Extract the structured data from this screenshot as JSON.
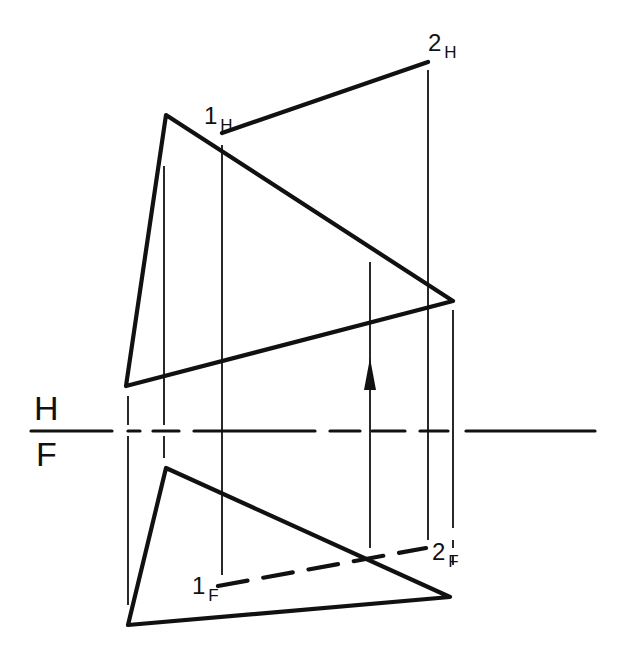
{
  "diagram": {
    "title": "",
    "colors": {
      "ink": "#111111",
      "background": "#ffffff"
    },
    "fold_line": {
      "label_top": "H",
      "label_bottom": "F",
      "y": 431,
      "segments": [
        [
          31,
          112
        ],
        [
          128,
          140
        ],
        [
          153,
          179
        ],
        [
          194,
          315
        ],
        [
          330,
          360
        ],
        [
          372,
          405
        ],
        [
          420,
          448
        ],
        [
          466,
          595
        ]
      ]
    },
    "horizontal_view": {
      "plane_triangle": {
        "vertices": [
          [
            166,
            115
          ],
          [
            453,
            301
          ],
          [
            126,
            386
          ]
        ]
      },
      "line": {
        "start": {
          "label": "1",
          "sub": "H",
          "x": 222,
          "y": 133
        },
        "end": {
          "label": "2",
          "sub": "H",
          "x": 428,
          "y": 62
        }
      }
    },
    "frontal_view": {
      "plane_triangle": {
        "vertices": [
          [
            166,
            468
          ],
          [
            450,
            597
          ],
          [
            128,
            625
          ]
        ]
      },
      "line": {
        "start": {
          "label": "1",
          "sub": "F",
          "x": 218,
          "y": 586
        },
        "end": {
          "label": "2",
          "sub": "F",
          "x": 426,
          "y": 548
        },
        "style": "dashed"
      }
    },
    "projectors": [
      {
        "x": 128,
        "segments": [
          [
            396,
            425
          ],
          [
            436,
            605
          ]
        ]
      },
      {
        "x": 164,
        "segments": [
          [
            166,
            425
          ],
          [
            436,
            458
          ]
        ]
      },
      {
        "x": 222,
        "segments": [
          [
            145,
            575
          ]
        ]
      },
      {
        "x": 370,
        "segments": [
          [
            262,
            548
          ]
        ],
        "arrow": {
          "y": 368,
          "direction": "up"
        }
      },
      {
        "x": 428,
        "segments": [
          [
            70,
            540
          ]
        ]
      },
      {
        "x": 453,
        "segments": [
          [
            310,
            528
          ],
          [
            540,
            548
          ],
          [
            556,
            565
          ]
        ]
      }
    ],
    "labels": [
      {
        "id": "1H",
        "text": "1",
        "sub": "H",
        "x": 204,
        "y": 124
      },
      {
        "id": "2H",
        "text": "2",
        "sub": "H",
        "x": 428,
        "y": 51
      },
      {
        "id": "1F",
        "text": "1",
        "sub": "F",
        "x": 192,
        "y": 594
      },
      {
        "id": "2F",
        "text": "2",
        "sub": "F",
        "x": 432,
        "y": 560
      }
    ]
  }
}
